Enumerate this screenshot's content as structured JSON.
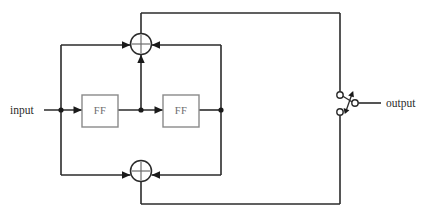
{
  "figure": {
    "type": "block-diagram",
    "title": "",
    "background_color": "#ffffff",
    "line_color": "#2b2b2b",
    "box_border_color": "#8a8a8a",
    "box_label_color": "#6b6b6b"
  },
  "labels": {
    "input": "input",
    "output": "output"
  },
  "blocks": [
    {
      "id": "ff1",
      "label": "FF",
      "x": 82,
      "y": 95,
      "width": 36,
      "height": 32
    },
    {
      "id": "ff2",
      "label": "FF",
      "x": 163,
      "y": 95,
      "width": 36,
      "height": 32
    }
  ],
  "adders": [
    {
      "id": "adder-top",
      "symbol": "crossed-circle",
      "cx": 141,
      "cy": 44,
      "r": 10.5,
      "inputs": [
        "left",
        "right",
        "bottom"
      ],
      "outputs": [
        "top"
      ]
    },
    {
      "id": "adder-bottom",
      "symbol": "crossed-circle",
      "cx": 141,
      "cy": 171,
      "r": 10.5,
      "inputs": [
        "left",
        "right"
      ],
      "outputs": [
        "bottom"
      ]
    }
  ],
  "junctions": [
    {
      "id": "node-input-tap",
      "x": 61,
      "y": 110
    },
    {
      "id": "node-ff1-out",
      "x": 141,
      "y": 110
    },
    {
      "id": "node-ff2-out",
      "x": 221,
      "y": 110
    }
  ],
  "switch": {
    "id": "output-switch",
    "type": "spdt-toggle",
    "pole_terminal": {
      "x": 355,
      "y": 103,
      "r": 3.2
    },
    "throw_terminals": [
      {
        "id": "throw-upper",
        "x": 340,
        "y": 95,
        "r": 3.2
      },
      {
        "id": "throw-lower",
        "x": 340,
        "y": 112,
        "r": 3.2
      }
    ],
    "motion_indicator": "double-headed-arrow"
  },
  "wires": [
    {
      "id": "input-wire",
      "from": "input-label",
      "to": "node-input-tap"
    },
    {
      "id": "input-to-ff1",
      "from": "node-input-tap",
      "to": "ff1",
      "arrow": true
    },
    {
      "id": "ff1-to-node",
      "from": "ff1",
      "to": "node-ff1-out"
    },
    {
      "id": "node-to-ff2",
      "from": "node-ff1-out",
      "to": "ff2",
      "arrow": true
    },
    {
      "id": "ff2-to-node",
      "from": "ff2",
      "to": "node-ff2-out"
    },
    {
      "id": "node-ff1-out-to-adder-top",
      "from": "node-ff1-out",
      "to": "adder-top",
      "arrow": true
    },
    {
      "id": "left-feedback-vertical",
      "from": "node-input-tap",
      "to": "left-rail"
    },
    {
      "id": "left-rail-to-adder-top",
      "from": "left-rail",
      "to": "adder-top",
      "arrow": true
    },
    {
      "id": "left-rail-to-adder-bottom",
      "from": "left-rail",
      "to": "adder-bottom",
      "arrow": true
    },
    {
      "id": "right-rail-vertical",
      "from": "node-ff2-out",
      "to": "right-rail"
    },
    {
      "id": "right-rail-to-adder-top",
      "from": "right-rail",
      "to": "adder-top",
      "arrow": true
    },
    {
      "id": "right-rail-to-adder-bottom",
      "from": "right-rail",
      "to": "adder-bottom",
      "arrow": true
    },
    {
      "id": "adder-top-to-switch-upper",
      "from": "adder-top",
      "to": "throw-upper"
    },
    {
      "id": "adder-bottom-to-switch-lower",
      "from": "adder-bottom",
      "to": "throw-lower"
    },
    {
      "id": "switch-pole-to-output",
      "from": "pole_terminal",
      "to": "output-label"
    }
  ]
}
